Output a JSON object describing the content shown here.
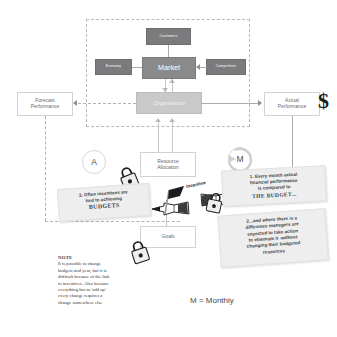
{
  "diagram": {
    "boundary_name": "organisation-system-boundary",
    "nodes": {
      "customers": "Customers",
      "economy": "Economy",
      "competitors": "Competitors",
      "market": "Market",
      "organisation": "Organisation",
      "forecast": "Forecast\nPerformance",
      "forecast_line1": "Forecast",
      "forecast_line2": "Performance",
      "actual_line1": "Actual",
      "actual_line2": "Performance",
      "resource_line1": "Resource",
      "resource_line2": "Allocation",
      "goals": "Goals"
    },
    "edge_labels": {
      "incentive": "Incentive"
    },
    "cycle_markers": {
      "annual": "A",
      "monthly": "M"
    },
    "money_icon": "$",
    "callouts": [
      {
        "name": "callout-monthly-comparison",
        "lines": [
          "1. Every month actual",
          "financial performance",
          "is compared to "
        ],
        "emphasis": "THE BUDGET..."
      },
      {
        "name": "callout-take-action",
        "lines": [
          "2...and where there is a",
          "difference managers are",
          "expected to take action",
          "to eliminate it -without",
          "changing their budgeted",
          "resources"
        ]
      },
      {
        "name": "callout-incentives",
        "lines": [
          "3. Often incentives are",
          "tied to achieving"
        ],
        "emphasis": "BUDGETS"
      }
    ],
    "note": {
      "heading": "NOTE",
      "lines": [
        "It is possible to change",
        "budgets mid year, but it is",
        "difficult because of the link",
        "to incentives. Also because",
        "everything has to 'add up'",
        "every change requires a",
        "change somewhere else"
      ]
    },
    "legend": "M = Monthly",
    "colors": {
      "dark_box": "#7b7b7d",
      "market_box": "#8a8a8c",
      "org_box": "#c9c9cb",
      "white_box": "#ffffff",
      "boundary_dash": "#b9b9bb",
      "sticky": "#eeeeef",
      "text": "#58585a"
    }
  }
}
